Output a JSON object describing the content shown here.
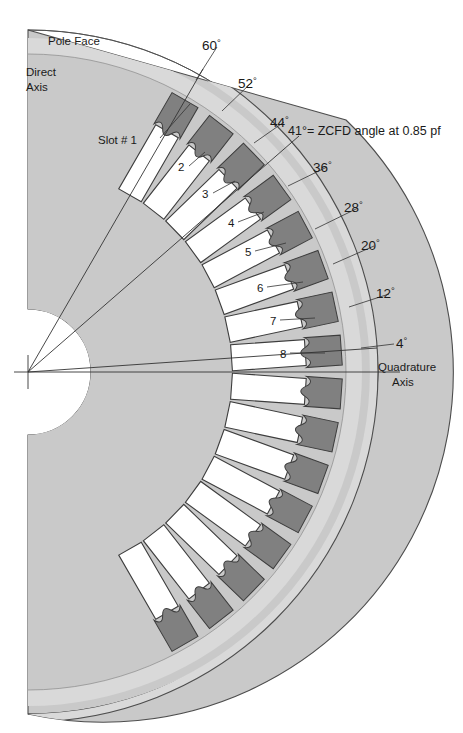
{
  "figure": {
    "type": "engineering-cross-section",
    "labels": {
      "pole_face": "Pole Face",
      "direct_axis_line1": "Direct",
      "direct_axis_line2": "Axis",
      "quadrature_axis_line1": "Quadrature",
      "quadrature_axis_line2": "Axis",
      "slot_one": "Slot # 1",
      "zcfd_note": "41°= ZCFD angle at 0.85 pf"
    },
    "colors": {
      "body_fill": "#c9c9c9",
      "rim_fill": "#d9d9d9",
      "wedge_fill": "#808080",
      "slot_fill": "#ffffff",
      "outline": "#4d4d4d",
      "leader": "#333333",
      "text": "#1a1a1a",
      "background": "#ffffff"
    },
    "geometry": {
      "center_x": 28,
      "center_y": 372,
      "bore_radius": 63,
      "outer_radius": 350,
      "rim_inner_radius": 318,
      "slot_pitch_deg": 8,
      "slot_count_total": 16,
      "first_slot_angle_deg": 60,
      "last_slot_angle_deg": -60
    },
    "angles_labeled": [
      {
        "value": 60,
        "text": "60",
        "slot": "1"
      },
      {
        "value": 52,
        "text": "52",
        "slot": "2"
      },
      {
        "value": 44,
        "text": "44",
        "slot": "3"
      },
      {
        "value": 36,
        "text": "36",
        "slot": "4"
      },
      {
        "value": 28,
        "text": "28",
        "slot": "5"
      },
      {
        "value": 20,
        "text": "20",
        "slot": "6"
      },
      {
        "value": 12,
        "text": "12",
        "slot": "7"
      },
      {
        "value": 4,
        "text": "4",
        "slot": "8"
      }
    ],
    "slot_numbers": [
      "1",
      "2",
      "3",
      "4",
      "5",
      "6",
      "7",
      "8"
    ],
    "degree_symbol": "°",
    "radial_lines_deg": [
      60,
      41,
      4
    ],
    "zcfd_angle_deg": 41,
    "power_factor": "0.85"
  }
}
